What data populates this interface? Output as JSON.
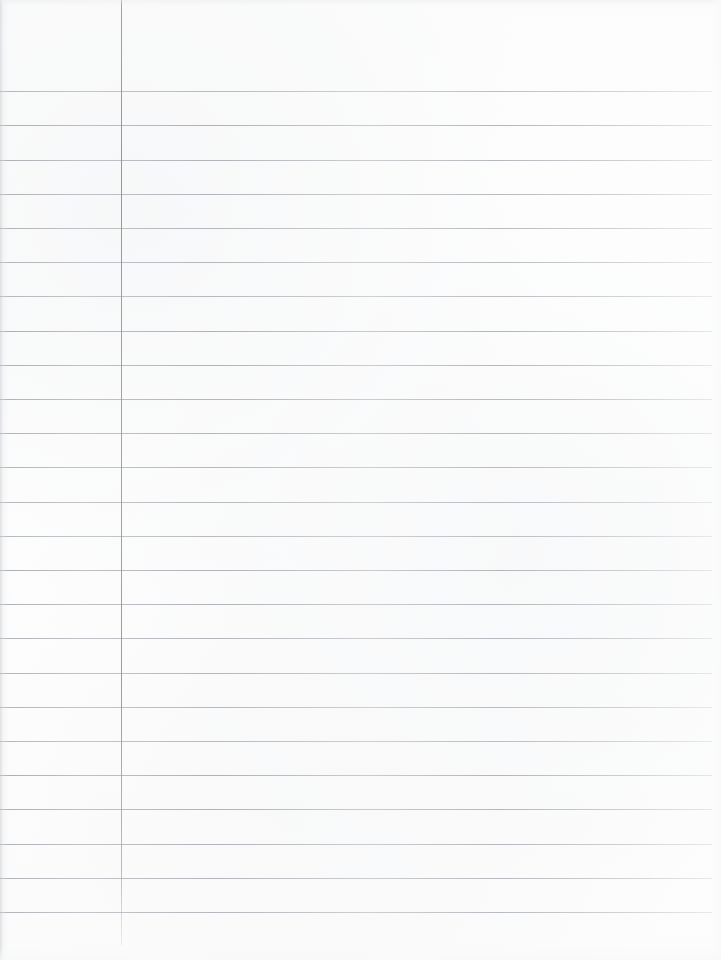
{
  "document": {
    "kind": "scanned-lined-notebook-page",
    "title": "Blank Lined Notebook Page",
    "content_text": "",
    "page_width": 721,
    "page_height": 960,
    "background_color": "#fdfdfd",
    "is_blank": "true"
  },
  "ruling": {
    "line_color": "#9ea2a7",
    "margin_line_color": "#92969c",
    "line_thickness_px": 1,
    "line_spacing_px": 34.25,
    "first_line_y": 91,
    "line_count": 25,
    "line_start_x": 0,
    "line_end_x": 712,
    "header_space_px": 91
  },
  "margin_rule": {
    "x": 121,
    "top_y": 0,
    "bottom_y": 946,
    "label": "left-margin-rule"
  },
  "regions": {
    "header_label": "header area",
    "left_margin_label": "left margin column",
    "body_label": "writing body area",
    "footer_label": "footer area"
  },
  "line_ys": [
    91,
    125,
    160,
    194,
    228,
    262,
    296,
    331,
    365,
    399,
    433,
    467,
    502,
    536,
    570,
    604,
    638,
    673,
    707,
    741,
    775,
    809,
    844,
    878,
    912
  ]
}
